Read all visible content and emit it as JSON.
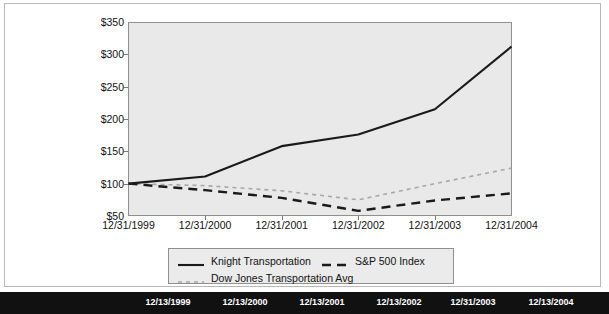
{
  "chart_data": {
    "type": "line",
    "title": "",
    "xlabel": "",
    "ylabel": "",
    "grid": false,
    "legend_position": "bottom",
    "ylim": [
      50,
      350
    ],
    "ytick_labels": [
      "$350",
      "$300",
      "$250",
      "$200",
      "$150",
      "$100",
      "$50"
    ],
    "ytick_values": [
      350,
      300,
      250,
      200,
      150,
      100,
      50
    ],
    "categories": [
      "12/31/1999",
      "12/31/2000",
      "12/31/2001",
      "12/31/2002",
      "12/31/2003",
      "12/31/2004"
    ],
    "series": [
      {
        "name": "Knight Transportation",
        "style": "solid",
        "color": "#1a1a1a",
        "values": [
          100,
          111,
          158,
          176,
          215,
          312
        ]
      },
      {
        "name": "S&P 500 Index",
        "style": "long-dash",
        "color": "#1a1a1a",
        "values": [
          100,
          90,
          78,
          58,
          74,
          85
        ]
      },
      {
        "name": "Dow Jones Transportation Avg",
        "style": "short-dash",
        "color": "#a8a8a8",
        "values": [
          100,
          97,
          89,
          75,
          100,
          124
        ]
      }
    ]
  },
  "legend": {
    "entries": [
      {
        "label": "Knight Transportation",
        "style": "solid"
      },
      {
        "label": "S&P 500 Index",
        "style": "long-dash"
      },
      {
        "label": "Dow Jones Transportation Avg",
        "style": "short-dash"
      }
    ]
  },
  "footer": {
    "labels": [
      "12/13/1999",
      "12/13/2000",
      "12/13/2001",
      "12/13/2002",
      "12/31/2003",
      "12/13/2004"
    ]
  },
  "colors": {
    "plot_background": "#e9e9e9",
    "plot_border": "#8f8f8f",
    "page_background": "#ffffff",
    "footer_background": "#111111",
    "knight_line": "#1a1a1a",
    "sp500_line": "#1a1a1a",
    "dowjones_line": "#a8a8a8"
  }
}
